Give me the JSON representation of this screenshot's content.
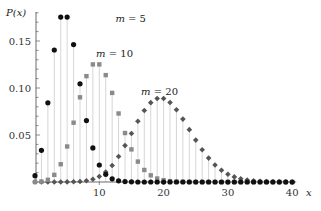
{
  "chart_data": {
    "type": "scatter",
    "subtype": "stem",
    "title": "",
    "xlabel": "x",
    "ylabel": "P(x)",
    "xlim": [
      0,
      40
    ],
    "ylim": [
      0,
      0.18
    ],
    "xticks": [
      10,
      20,
      30,
      40
    ],
    "xtick_labels": [
      "10",
      "20",
      "30",
      "40"
    ],
    "yticks": [
      0.05,
      0.1,
      0.15
    ],
    "ytick_labels": [
      "0.05",
      "0.10",
      "0.15"
    ],
    "y_minor_step": 0.01,
    "grid": false,
    "legend": "inline labels",
    "x": [
      0,
      1,
      2,
      3,
      4,
      5,
      6,
      7,
      8,
      9,
      10,
      11,
      12,
      13,
      14,
      15,
      16,
      17,
      18,
      19,
      20,
      21,
      22,
      23,
      24,
      25,
      26,
      27,
      28,
      29,
      30,
      31,
      32,
      33,
      34,
      35,
      36,
      37,
      38,
      39,
      40
    ],
    "series": [
      {
        "name": "m = 5",
        "marker": "circle",
        "color": "#111111",
        "label_pos": [
          12.5,
          0.175
        ],
        "values": [
          0.0067,
          0.0337,
          0.0842,
          0.1404,
          0.1755,
          0.1755,
          0.1462,
          0.1044,
          0.0653,
          0.0363,
          0.0181,
          0.0082,
          0.0034,
          0.0013,
          0.0005,
          0.0002,
          0,
          0,
          0,
          0,
          0,
          0,
          0,
          0,
          0,
          0,
          0,
          0,
          0,
          0,
          0,
          0,
          0,
          0,
          0,
          0,
          0,
          0,
          0,
          0,
          0
        ]
      },
      {
        "name": "m = 10",
        "marker": "square",
        "color": "#8a8a8a",
        "label_pos": [
          9.5,
          0.137
        ],
        "values": [
          0.0,
          0.0005,
          0.0023,
          0.0076,
          0.0189,
          0.0378,
          0.0631,
          0.0901,
          0.1126,
          0.1251,
          0.1251,
          0.1137,
          0.0948,
          0.0729,
          0.0521,
          0.0347,
          0.0217,
          0.0128,
          0.0071,
          0.0037,
          0.0019,
          0.0009,
          0.0004,
          0.0002,
          0.0001,
          0,
          0,
          0,
          0,
          0,
          0,
          0,
          0,
          0,
          0,
          0,
          0,
          0,
          0,
          0,
          0
        ]
      },
      {
        "name": "m = 20",
        "marker": "diamond",
        "color": "#555555",
        "label_pos": [
          16.5,
          0.097
        ],
        "values": [
          0,
          0,
          0,
          0,
          0,
          0.0001,
          0.0002,
          0.0005,
          0.0013,
          0.0029,
          0.0058,
          0.0106,
          0.0176,
          0.0271,
          0.0387,
          0.0516,
          0.0646,
          0.076,
          0.0844,
          0.0888,
          0.0888,
          0.0846,
          0.0769,
          0.0669,
          0.0557,
          0.0446,
          0.0343,
          0.0254,
          0.0181,
          0.0125,
          0.0083,
          0.0054,
          0.0034,
          0.002,
          0.0012,
          0.0007,
          0.0004,
          0.0002,
          0.0001,
          0.0001,
          0.0
        ]
      }
    ],
    "stem_color": "#cccccc",
    "axis_color": "#444444"
  }
}
